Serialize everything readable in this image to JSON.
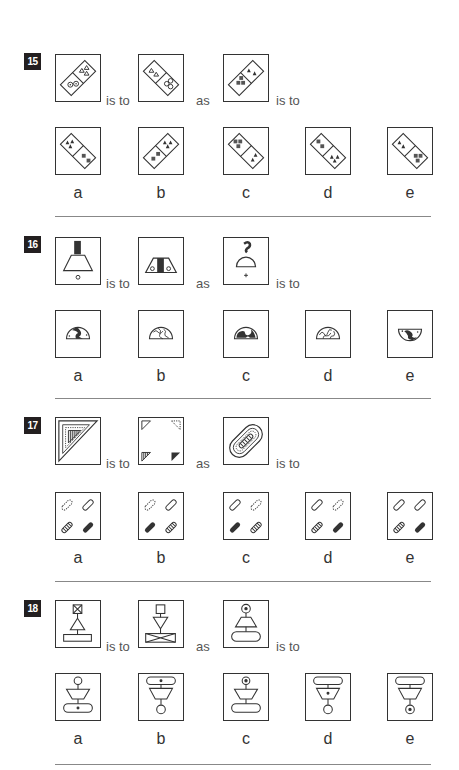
{
  "connectors": {
    "is_to": "is to",
    "as": "as"
  },
  "option_labels": [
    "a",
    "b",
    "c",
    "d",
    "e"
  ],
  "questions": [
    {
      "number": "15",
      "prompt": [
        {
          "figure": "domino-triangles-top-circles-bottom"
        },
        {
          "figure": "domino-triangles-left-circles-right"
        },
        {
          "figure": "domino-trees-top-boxes-bottom"
        }
      ],
      "options": [
        {
          "label": "a",
          "figure": "domino-trees-left-boxes-right"
        },
        {
          "label": "b",
          "figure": "domino-trees-top-boxes-bottom"
        },
        {
          "label": "c",
          "figure": "domino-boxes-left-trees-right"
        },
        {
          "label": "d",
          "figure": "domino-boxes-left-trees-right-alt"
        },
        {
          "label": "e",
          "figure": "domino-trees-left-3boxes-right"
        }
      ]
    },
    {
      "number": "16",
      "prompt": [
        {
          "figure": "lamp-rectangle-on-trapezoid-circle"
        },
        {
          "figure": "trapezoid-with-rectangle-and-circles"
        },
        {
          "figure": "squiggle-on-dome-plus"
        }
      ],
      "options": [
        {
          "label": "a",
          "figure": "dome-with-dark-squiggle-dots"
        },
        {
          "label": "b",
          "figure": "dome-with-white-squiggles"
        },
        {
          "label": "c",
          "figure": "dome-with-dark-squiggle"
        },
        {
          "label": "d",
          "figure": "dome-with-outline-squiggles"
        },
        {
          "label": "e",
          "figure": "inverted-dome-with-dark-squiggle"
        }
      ]
    },
    {
      "number": "17",
      "prompt": [
        {
          "figure": "nested-triangles"
        },
        {
          "figure": "four-corner-triangles"
        },
        {
          "figure": "nested-capsules"
        }
      ],
      "options": [
        {
          "label": "a",
          "figure": "four-capsules-dotted-tl"
        },
        {
          "label": "b",
          "figure": "four-capsules-dotted-tl-dark-bl"
        },
        {
          "label": "c",
          "figure": "four-capsules-dotted-tr-dark-bl"
        },
        {
          "label": "d",
          "figure": "four-capsules-dotted-tr-striped-bl"
        },
        {
          "label": "e",
          "figure": "four-capsules-no-dotted"
        }
      ]
    },
    {
      "number": "18",
      "prompt": [
        {
          "figure": "crossed-square-triangle-rectangle"
        },
        {
          "figure": "square-inverted-triangle-crossed-rectangle"
        },
        {
          "figure": "dotted-circle-trapezoid-capsule"
        }
      ],
      "options": [
        {
          "label": "a",
          "figure": "circle-inverted-trapezoid-dotted-capsule"
        },
        {
          "label": "b",
          "figure": "dotted-capsule-inverted-trapezoid-circle"
        },
        {
          "label": "c",
          "figure": "dotted-circle-inverted-trapezoid-capsule"
        },
        {
          "label": "d",
          "figure": "capsule-dotted-inverted-trapezoid-circle"
        },
        {
          "label": "e",
          "figure": "capsule-inverted-trapezoid-dotted-circle"
        }
      ]
    }
  ]
}
